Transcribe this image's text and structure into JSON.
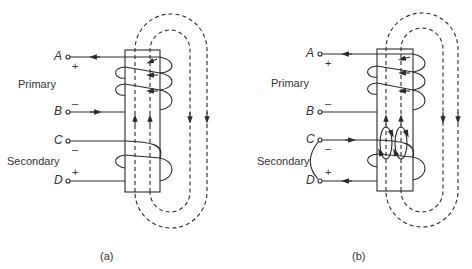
{
  "figures": [
    {
      "id": "a",
      "caption": "(a)",
      "primary_label": "Primary",
      "secondary_label": "Secondary",
      "terminals": [
        {
          "name": "A",
          "sign": "+"
        },
        {
          "name": "B",
          "sign": "–"
        },
        {
          "name": "C",
          "sign": "–"
        },
        {
          "name": "D",
          "sign": "+"
        }
      ],
      "description": "Transformer with primary and secondary windings on a core; secondary open-circuited; dashed magnetic flux path loops through core"
    },
    {
      "id": "b",
      "caption": "(b)",
      "primary_label": "Primary",
      "secondary_label": "Secondary",
      "terminals": [
        {
          "name": "A",
          "sign": "+"
        },
        {
          "name": "B",
          "sign": "–"
        },
        {
          "name": "C",
          "sign": "–"
        },
        {
          "name": "D",
          "sign": "+"
        }
      ],
      "description": "Same transformer with secondary short-circuited; induced circulating flux loops around secondary winding"
    }
  ],
  "colors": {
    "line": "#2a2a2a",
    "background": "#ffffff"
  }
}
